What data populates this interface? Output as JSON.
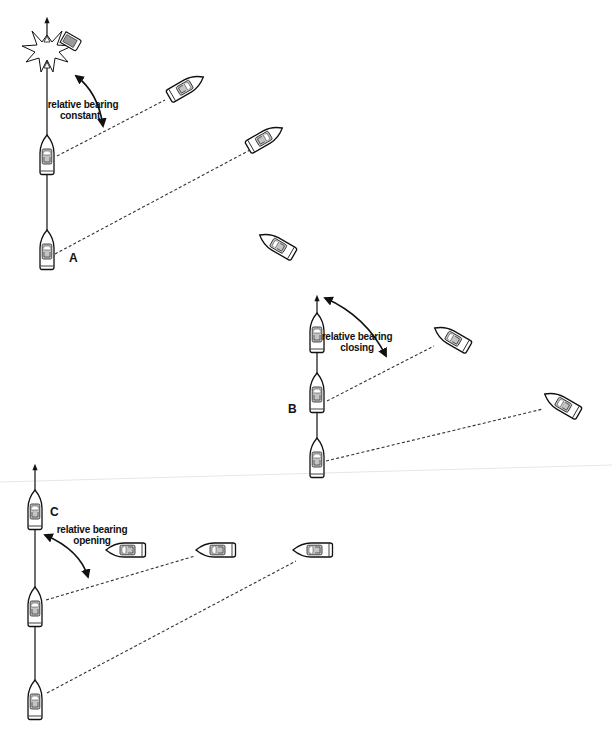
{
  "figure": {
    "colors": {
      "ink": "#111111",
      "background": "#ffffff",
      "cabin_fill": "#bfbfbf",
      "fold_line": "#e6e6e6"
    }
  },
  "scenarios": [
    {
      "id": "A",
      "letter": "A",
      "caption_line1": "relative bearing",
      "caption_line2": "constant",
      "outcome": "collision",
      "own_track": {
        "x": 47,
        "arrow_tip_y": 18,
        "positions_y": [
          155,
          250
        ]
      },
      "other_vessel_positions": [
        {
          "x": 265,
          "y": 138,
          "heading_deg": -60
        },
        {
          "x": 186,
          "y": 87,
          "heading_deg": -60
        },
        {
          "x": 67,
          "y": 43,
          "heading_deg": -60
        }
      ],
      "collision_marker": {
        "x": 47,
        "y": 48,
        "icon": "explosion-starburst-icon"
      }
    },
    {
      "id": "B",
      "letter": "B",
      "caption_line1": "relative bearing",
      "caption_line2": "closing",
      "outcome": "other vessel passes ahead",
      "own_track": {
        "x": 317,
        "arrow_tip_y": 296,
        "positions_y": [
          458,
          393,
          333
        ]
      },
      "other_vessel_positions": [
        {
          "x": 562,
          "y": 404,
          "heading_deg": -60
        },
        {
          "x": 452,
          "y": 338,
          "heading_deg": -60
        },
        {
          "x": 277,
          "y": 245,
          "heading_deg": -60
        }
      ]
    },
    {
      "id": "C",
      "letter": "C",
      "caption_line1": "relative bearing",
      "caption_line2": "opening",
      "outcome": "other vessel passes astern",
      "own_track": {
        "x": 35,
        "arrow_tip_y": 465,
        "positions_y": [
          700,
          607,
          510
        ]
      },
      "other_vessel_positions": [
        {
          "x": 312,
          "y": 550,
          "heading_deg": -90
        },
        {
          "x": 215,
          "y": 550,
          "heading_deg": -90
        },
        {
          "x": 125,
          "y": 550,
          "heading_deg": -90
        }
      ]
    }
  ]
}
